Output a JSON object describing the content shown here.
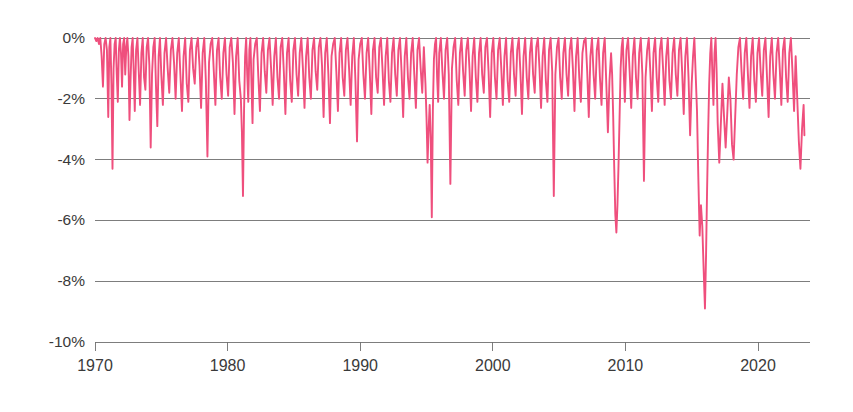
{
  "chart_data": {
    "type": "line",
    "title": "",
    "subtitle": "",
    "xlabel": "",
    "ylabel": "",
    "xlim": [
      1970,
      2023.6
    ],
    "ylim": [
      -10,
      0
    ],
    "grid": true,
    "legend": false,
    "y_ticks": [
      0,
      -2,
      -4,
      -6,
      -8,
      -10
    ],
    "y_tick_labels": [
      "0%",
      "-2%",
      "-4%",
      "-6%",
      "-8%",
      "-10%"
    ],
    "x_ticks": [
      1970,
      1980,
      1990,
      2000,
      2010,
      2020
    ],
    "x_tick_labels": [
      "1970",
      "1980",
      "1990",
      "2000",
      "2010",
      "2020"
    ],
    "series": [
      {
        "name": "drawdown",
        "color": "#ef4f7d",
        "x": [
          1970.0,
          1970.1,
          1970.2,
          1970.3,
          1970.4,
          1970.5,
          1970.6,
          1970.7,
          1970.8,
          1970.9,
          1971.0,
          1971.08,
          1971.16,
          1971.24,
          1971.32,
          1971.4,
          1971.48,
          1971.56,
          1971.64,
          1971.72,
          1971.8,
          1971.88,
          1971.96,
          1972.04,
          1972.12,
          1972.2,
          1972.28,
          1972.36,
          1972.44,
          1972.52,
          1972.6,
          1972.68,
          1972.76,
          1972.84,
          1972.92,
          1973.0,
          1973.1,
          1973.2,
          1973.3,
          1973.4,
          1973.5,
          1973.6,
          1973.7,
          1973.8,
          1973.9,
          1974.0,
          1974.1,
          1974.2,
          1974.3,
          1974.4,
          1974.5,
          1974.6,
          1974.7,
          1974.8,
          1974.9,
          1975.0,
          1975.12,
          1975.24,
          1975.36,
          1975.48,
          1975.6,
          1975.72,
          1975.84,
          1975.96,
          1976.08,
          1976.2,
          1976.32,
          1976.44,
          1976.56,
          1976.68,
          1976.8,
          1976.92,
          1977.04,
          1977.16,
          1977.28,
          1977.4,
          1977.52,
          1977.64,
          1977.76,
          1977.88,
          1978.0,
          1978.12,
          1978.24,
          1978.36,
          1978.48,
          1978.6,
          1978.72,
          1978.84,
          1978.96,
          1979.08,
          1979.2,
          1979.32,
          1979.44,
          1979.56,
          1979.68,
          1979.8,
          1979.92,
          1980.04,
          1980.16,
          1980.28,
          1980.4,
          1980.52,
          1980.64,
          1980.76,
          1980.88,
          1981.0,
          1981.08,
          1981.16,
          1981.24,
          1981.32,
          1981.4,
          1981.48,
          1981.56,
          1981.64,
          1981.72,
          1981.8,
          1981.88,
          1981.96,
          1982.08,
          1982.2,
          1982.32,
          1982.44,
          1982.56,
          1982.68,
          1982.8,
          1982.92,
          1983.04,
          1983.16,
          1983.28,
          1983.4,
          1983.52,
          1983.64,
          1983.76,
          1983.88,
          1984.0,
          1984.12,
          1984.24,
          1984.36,
          1984.48,
          1984.6,
          1984.72,
          1984.84,
          1984.96,
          1985.08,
          1985.2,
          1985.32,
          1985.44,
          1985.56,
          1985.68,
          1985.8,
          1985.92,
          1986.04,
          1986.16,
          1986.28,
          1986.4,
          1986.52,
          1986.64,
          1986.76,
          1986.88,
          1987.0,
          1987.12,
          1987.24,
          1987.36,
          1987.48,
          1987.6,
          1987.72,
          1987.84,
          1987.96,
          1988.08,
          1988.2,
          1988.32,
          1988.44,
          1988.56,
          1988.68,
          1988.8,
          1988.92,
          1989.04,
          1989.16,
          1989.28,
          1989.4,
          1989.52,
          1989.64,
          1989.76,
          1989.88,
          1990.0,
          1990.12,
          1990.24,
          1990.36,
          1990.48,
          1990.6,
          1990.72,
          1990.84,
          1990.96,
          1991.08,
          1991.2,
          1991.32,
          1991.44,
          1991.56,
          1991.68,
          1991.8,
          1991.92,
          1992.04,
          1992.16,
          1992.28,
          1992.4,
          1992.52,
          1992.64,
          1992.76,
          1992.88,
          1993.0,
          1993.12,
          1993.24,
          1993.36,
          1993.48,
          1993.6,
          1993.72,
          1993.84,
          1993.96,
          1994.08,
          1994.2,
          1994.32,
          1994.44,
          1994.56,
          1994.68,
          1994.8,
          1994.92,
          1995.0,
          1995.08,
          1995.16,
          1995.24,
          1995.32,
          1995.4,
          1995.48,
          1995.56,
          1995.64,
          1995.72,
          1995.8,
          1995.88,
          1995.96,
          1996.08,
          1996.2,
          1996.32,
          1996.44,
          1996.56,
          1996.68,
          1996.8,
          1996.92,
          1997.04,
          1997.16,
          1997.28,
          1997.4,
          1997.52,
          1997.64,
          1997.76,
          1997.88,
          1998.0,
          1998.12,
          1998.24,
          1998.36,
          1998.48,
          1998.6,
          1998.72,
          1998.84,
          1998.96,
          1999.08,
          1999.2,
          1999.32,
          1999.44,
          1999.56,
          1999.68,
          1999.8,
          1999.92,
          2000.04,
          2000.16,
          2000.28,
          2000.4,
          2000.52,
          2000.64,
          2000.76,
          2000.88,
          2001.0,
          2001.12,
          2001.24,
          2001.36,
          2001.48,
          2001.6,
          2001.72,
          2001.84,
          2001.96,
          2002.08,
          2002.2,
          2002.32,
          2002.44,
          2002.56,
          2002.68,
          2002.8,
          2002.92,
          2003.04,
          2003.16,
          2003.28,
          2003.4,
          2003.52,
          2003.64,
          2003.76,
          2003.88,
          2004.0,
          2004.12,
          2004.24,
          2004.36,
          2004.48,
          2004.6,
          2004.72,
          2004.84,
          2004.96,
          2005.08,
          2005.2,
          2005.32,
          2005.44,
          2005.56,
          2005.68,
          2005.8,
          2005.92,
          2006.04,
          2006.16,
          2006.28,
          2006.4,
          2006.52,
          2006.64,
          2006.76,
          2006.88,
          2007.0,
          2007.12,
          2007.24,
          2007.36,
          2007.48,
          2007.6,
          2007.72,
          2007.84,
          2007.96,
          2008.08,
          2008.2,
          2008.32,
          2008.44,
          2008.56,
          2008.68,
          2008.8,
          2008.92,
          2009.0,
          2009.08,
          2009.16,
          2009.24,
          2009.32,
          2009.4,
          2009.48,
          2009.56,
          2009.64,
          2009.72,
          2009.8,
          2009.88,
          2009.96,
          2010.08,
          2010.2,
          2010.32,
          2010.44,
          2010.56,
          2010.68,
          2010.8,
          2010.92,
          2011.04,
          2011.16,
          2011.28,
          2011.4,
          2011.52,
          2011.64,
          2011.76,
          2011.88,
          2012.0,
          2012.12,
          2012.24,
          2012.36,
          2012.48,
          2012.6,
          2012.72,
          2012.84,
          2012.96,
          2013.08,
          2013.2,
          2013.32,
          2013.44,
          2013.56,
          2013.68,
          2013.8,
          2013.92,
          2014.04,
          2014.16,
          2014.28,
          2014.4,
          2014.52,
          2014.64,
          2014.76,
          2014.88,
          2015.0,
          2015.1,
          2015.2,
          2015.3,
          2015.4,
          2015.5,
          2015.6,
          2015.7,
          2015.8,
          2015.9,
          2016.0,
          2016.08,
          2016.16,
          2016.24,
          2016.32,
          2016.4,
          2016.48,
          2016.56,
          2016.64,
          2016.72,
          2016.8,
          2016.88,
          2016.96,
          2017.08,
          2017.2,
          2017.32,
          2017.44,
          2017.56,
          2017.68,
          2017.8,
          2017.92,
          2018.04,
          2018.16,
          2018.28,
          2018.4,
          2018.52,
          2018.64,
          2018.76,
          2018.88,
          2019.0,
          2019.12,
          2019.24,
          2019.36,
          2019.48,
          2019.6,
          2019.72,
          2019.84,
          2019.96,
          2020.08,
          2020.2,
          2020.32,
          2020.44,
          2020.56,
          2020.68,
          2020.8,
          2020.92,
          2021.04,
          2021.16,
          2021.28,
          2021.4,
          2021.52,
          2021.64,
          2021.76,
          2021.88,
          2022.0,
          2022.12,
          2022.24,
          2022.36,
          2022.48,
          2022.6,
          2022.72,
          2022.84,
          2022.96,
          2023.08,
          2023.2,
          2023.32,
          2023.44,
          2023.5
        ],
        "y": [
          0,
          -0.1,
          0,
          -0.2,
          0,
          -0.6,
          -1.6,
          -0.2,
          0,
          -0.4,
          -2.6,
          -0.3,
          0,
          -1.5,
          -4.3,
          -1.0,
          -0.2,
          0,
          -1.2,
          -2.1,
          -0.4,
          0,
          -0.5,
          -1.6,
          -0.2,
          0,
          -1.2,
          -0.3,
          0,
          -0.6,
          -2.7,
          -1.4,
          -0.3,
          0,
          -1.1,
          -2.4,
          -0.4,
          0,
          -1.1,
          -2.2,
          -0.5,
          0,
          -1.3,
          -1.7,
          -0.3,
          0,
          -0.9,
          -3.6,
          -1.2,
          -0.3,
          0,
          -1.6,
          -2.9,
          -0.6,
          0,
          -1.2,
          -2.2,
          -0.5,
          0,
          -1.0,
          -1.8,
          -0.4,
          0,
          -0.8,
          -2.0,
          -0.5,
          0,
          -1.2,
          -2.4,
          -0.6,
          0,
          -1.5,
          -2.1,
          -0.4,
          0,
          -1.0,
          -1.5,
          -0.3,
          0,
          -0.9,
          -2.3,
          -0.5,
          0,
          -1.4,
          -3.9,
          -0.8,
          -0.2,
          0,
          -1.1,
          -2.2,
          -0.4,
          0,
          -1.3,
          -2.0,
          -0.5,
          0,
          -1.2,
          -1.9,
          -0.3,
          0,
          -0.8,
          -2.5,
          -0.6,
          0,
          -1.4,
          -2.0,
          -3.1,
          -5.2,
          -2.4,
          -0.6,
          0,
          -1.2,
          -2.1,
          -0.4,
          0,
          -1.5,
          -2.8,
          -0.7,
          -0.2,
          0,
          -1.3,
          -2.4,
          -0.5,
          0,
          -1.1,
          -1.8,
          -0.4,
          0,
          -1.0,
          -2.2,
          -0.6,
          0,
          -1.3,
          -2.0,
          -0.3,
          0,
          -1.1,
          -2.5,
          -0.5,
          0,
          -1.4,
          -2.1,
          -0.4,
          0,
          -1.2,
          -1.9,
          -0.5,
          0,
          -1.0,
          -2.3,
          -0.6,
          0,
          -1.3,
          -2.0,
          -0.4,
          0,
          -1.1,
          -1.7,
          -0.3,
          0,
          -0.9,
          -2.6,
          -0.5,
          0,
          -1.2,
          -2.8,
          -0.6,
          -0.2,
          0,
          -1.1,
          -2.4,
          -0.5,
          0,
          -1.3,
          -1.9,
          -0.4,
          0,
          -1.0,
          -2.2,
          -0.6,
          0,
          -1.4,
          -3.4,
          -0.7,
          -0.2,
          0,
          -1.2,
          -2.0,
          -0.5,
          0,
          -1.1,
          -2.5,
          -0.4,
          0,
          -1.3,
          -1.8,
          -0.3,
          0,
          -1.0,
          -2.2,
          -0.6,
          0,
          -1.4,
          -2.1,
          -0.5,
          0,
          -1.2,
          -1.9,
          -0.4,
          0,
          -1.1,
          -2.6,
          -0.6,
          0,
          -1.3,
          -2.0,
          -0.5,
          0,
          -1.2,
          -2.3,
          -0.4,
          0,
          -1.0,
          -1.8,
          -0.3,
          -1.5,
          -2.6,
          -4.1,
          -3.0,
          -2.2,
          -3.3,
          -5.9,
          -2.4,
          -0.7,
          -0.2,
          0,
          -1.3,
          -2.1,
          -0.5,
          0,
          -1.1,
          -2.0,
          -0.4,
          0,
          -1.2,
          -4.8,
          -1.0,
          -0.3,
          0,
          -1.4,
          -2.2,
          -0.5,
          0,
          -1.1,
          -1.9,
          -0.4,
          0,
          -1.0,
          -2.4,
          -0.6,
          0,
          -1.3,
          -2.1,
          -0.5,
          0,
          -1.2,
          -1.8,
          -0.3,
          0,
          -1.1,
          -2.6,
          -0.5,
          0,
          -1.3,
          -2.0,
          -0.4,
          0,
          -1.0,
          -2.2,
          -0.6,
          0,
          -1.4,
          -2.1,
          -0.5,
          0,
          -1.2,
          -1.9,
          -0.4,
          0,
          -1.1,
          -2.5,
          -0.6,
          0,
          -1.3,
          -2.0,
          -0.5,
          0,
          -1.2,
          -1.8,
          -0.3,
          0,
          -1.0,
          -2.3,
          -0.6,
          0,
          -1.4,
          -2.1,
          -0.4,
          0,
          -1.1,
          -5.2,
          -1.2,
          -0.3,
          0,
          -1.3,
          -2.0,
          -0.5,
          0,
          -1.2,
          -1.9,
          -0.4,
          0,
          -1.0,
          -2.4,
          -0.6,
          0,
          -1.3,
          -2.1,
          -0.5,
          -0.1,
          0,
          -1.1,
          -2.6,
          -0.6,
          0,
          -1.2,
          -2.0,
          -0.4,
          0,
          -1.3,
          -2.2,
          -0.5,
          0,
          -1.5,
          -3.1,
          -1.4,
          -0.5,
          -1.2,
          -2.6,
          -4.3,
          -5.8,
          -6.4,
          -5.5,
          -4.2,
          -2.6,
          -1.0,
          -0.3,
          0,
          -1.2,
          -2.1,
          -0.4,
          0,
          -1.1,
          -2.3,
          -0.6,
          0,
          -1.3,
          -2.0,
          -0.5,
          0,
          -1.2,
          -4.7,
          -1.3,
          -0.4,
          0,
          -1.1,
          -2.4,
          -0.5,
          0,
          -1.3,
          -2.1,
          -0.4,
          0,
          -1.0,
          -2.2,
          -0.6,
          0,
          -1.4,
          -2.0,
          -0.5,
          0,
          -1.2,
          -1.9,
          -0.4,
          0,
          -1.1,
          -2.5,
          -0.6,
          0,
          -1.3,
          -3.2,
          -1.5,
          -0.6,
          0,
          -1.2,
          -2.4,
          -4.6,
          -6.5,
          -5.5,
          -6.2,
          -7.6,
          -8.9,
          -7.2,
          -5.0,
          -3.1,
          -1.5,
          -0.5,
          0,
          -1.2,
          -2.2,
          -0.5,
          0,
          -1.1,
          -2.8,
          -4.1,
          -2.8,
          -1.5,
          -2.6,
          -3.6,
          -2.5,
          -1.3,
          -2.0,
          -3.5,
          -4.0,
          -2.6,
          -1.2,
          -0.3,
          0,
          -1.1,
          -2.0,
          -0.5,
          0,
          -1.2,
          -2.3,
          -0.6,
          0,
          -1.4,
          -2.1,
          -0.5,
          0,
          -1.1,
          -1.9,
          -0.4,
          0,
          -1.3,
          -2.6,
          -0.6,
          0,
          -1.2,
          -2.0,
          -0.5,
          0,
          -1.0,
          -2.2,
          -0.4,
          0,
          -1.3,
          -2.1,
          -0.5,
          0,
          -1.1,
          -2.4,
          -0.6,
          -2.0,
          -3.4,
          -4.3,
          -3.0,
          -2.2,
          -3.2
        ]
      }
    ]
  },
  "axes": {
    "y_axis_name": "drawdown-percent-axis",
    "x_axis_name": "year-axis"
  }
}
